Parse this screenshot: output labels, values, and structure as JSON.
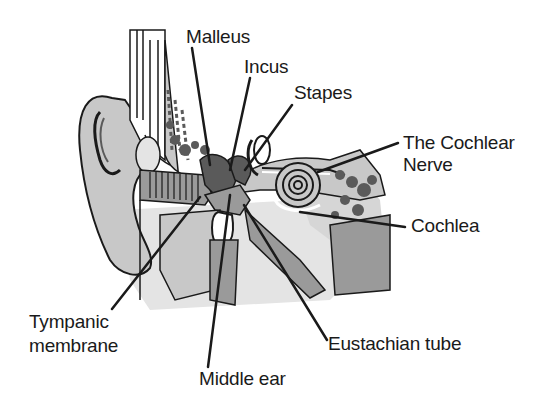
{
  "diagram": {
    "labels": {
      "malleus": "Malleus",
      "incus": "Incus",
      "stapes": "Stapes",
      "cochlear_nerve_line1": "The Cochlear",
      "cochlear_nerve_line2": "Nerve",
      "cochlea": "Cochlea",
      "tympanic_line1": "Tympanic",
      "tympanic_line2": "membrane",
      "middle_ear": "Middle ear",
      "eustachian_tube": "Eustachian tube"
    },
    "colors": {
      "ink": "#1a1a1a",
      "light_gray": "#c8c8c8",
      "mid_gray": "#9a9a9a",
      "dark_gray": "#5a5a5a",
      "bone_bg": "#e4e4e4",
      "background": "#ffffff"
    }
  }
}
